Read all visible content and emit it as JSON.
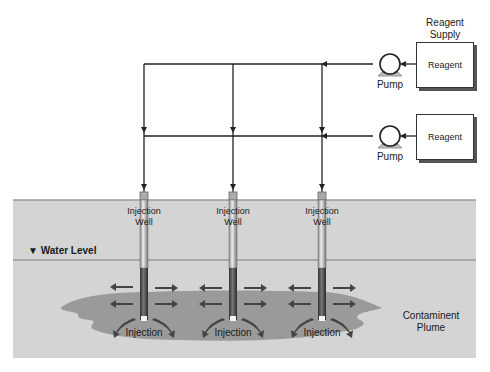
{
  "diagram": {
    "supply_label_line1": "Reagent",
    "supply_label_line2": "Supply",
    "reagent_boxes": [
      {
        "label": "Reagent"
      },
      {
        "label": "Reagent"
      }
    ],
    "pumps": [
      {
        "label": "Pump"
      },
      {
        "label": "Pump"
      }
    ],
    "wells": [
      {
        "label_line1": "Injection",
        "label_line2": "Well",
        "bottom_label": "Injection"
      },
      {
        "label_line1": "Injection",
        "label_line2": "Well",
        "bottom_label": "Injection"
      },
      {
        "label_line1": "Injection",
        "label_line2": "Well",
        "bottom_label": "Injection"
      }
    ],
    "water_level_label": "▼ Water Level",
    "plume_label_line1": "Contaminent",
    "plume_label_line2": "Plume",
    "colors": {
      "ground": "#d4d4d4",
      "plume": "#9a9a9a",
      "line": "#222222",
      "arrow": "#444444"
    }
  }
}
